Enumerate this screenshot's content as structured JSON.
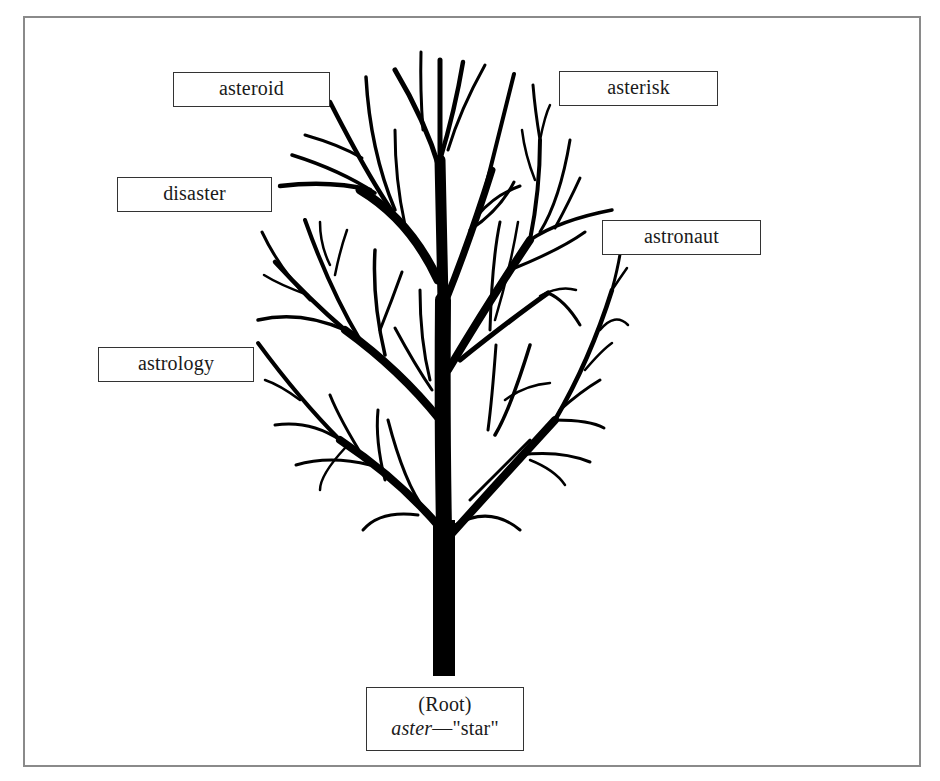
{
  "diagram": {
    "type": "word-family-tree",
    "colors": {
      "frame_border": "#8a8a8a",
      "tree": "#000000",
      "label_border": "#333333",
      "text": "#1a1a1a",
      "background": "#ffffff"
    },
    "root": {
      "line1": "(Root)",
      "root_word": "aster",
      "dash": "—",
      "meaning": "\"star\""
    },
    "branches": [
      {
        "label": "asteroid"
      },
      {
        "label": "asterisk"
      },
      {
        "label": "disaster"
      },
      {
        "label": "astronaut"
      },
      {
        "label": "astrology"
      }
    ]
  }
}
